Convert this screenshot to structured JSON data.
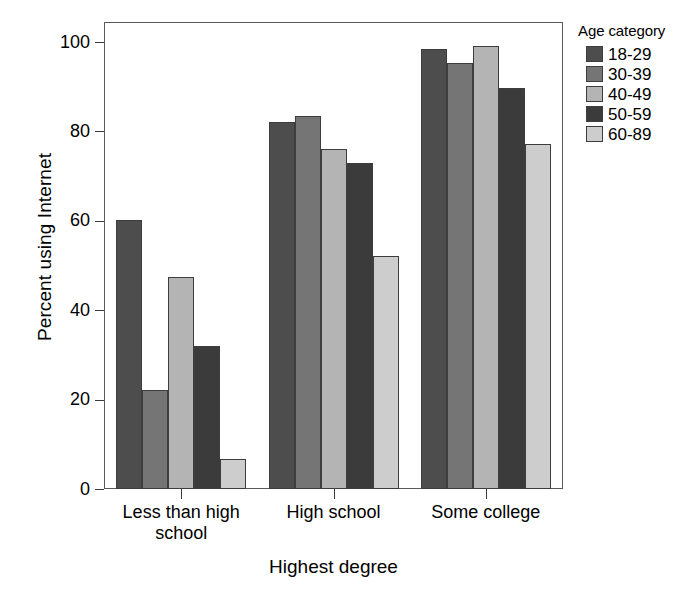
{
  "chart_data": {
    "type": "bar",
    "title": "",
    "xlabel": "Highest degree",
    "ylabel": "Percent using Internet",
    "categories": [
      "Less than high school",
      "High school",
      "Some college"
    ],
    "category_lines": [
      [
        "Less than high",
        "school"
      ],
      [
        "High school"
      ],
      [
        "Some college"
      ]
    ],
    "ylim": [
      0,
      100
    ],
    "yticks": [
      0,
      20,
      40,
      60,
      80,
      100
    ],
    "ytick_labels": [
      "0",
      "20",
      "40",
      "60",
      "80",
      "100"
    ],
    "grid": false,
    "legend_title": "Age category",
    "legend_position": "right",
    "series": [
      {
        "name": "18-29",
        "color": "#4d4d4d",
        "values": [
          60.2,
          82.2,
          98.4
        ]
      },
      {
        "name": "30-39",
        "color": "#757575",
        "values": [
          22.1,
          83.4,
          95.4
        ]
      },
      {
        "name": "40-49",
        "color": "#b4b4b4",
        "values": [
          47.4,
          76.1,
          99.1
        ]
      },
      {
        "name": "50-59",
        "color": "#3b3b3b",
        "values": [
          31.9,
          73.0,
          89.8
        ]
      },
      {
        "name": "60-89",
        "color": "#cdcdcd",
        "values": [
          6.7,
          52.2,
          77.2
        ]
      }
    ]
  },
  "axes": {
    "y_label": "Percent using Internet",
    "x_label": "Highest degree"
  },
  "legend": {
    "title": "Age category",
    "items": [
      {
        "label": "18-29"
      },
      {
        "label": "30-39"
      },
      {
        "label": "40-49"
      },
      {
        "label": "50-59"
      },
      {
        "label": "60-89"
      }
    ]
  }
}
